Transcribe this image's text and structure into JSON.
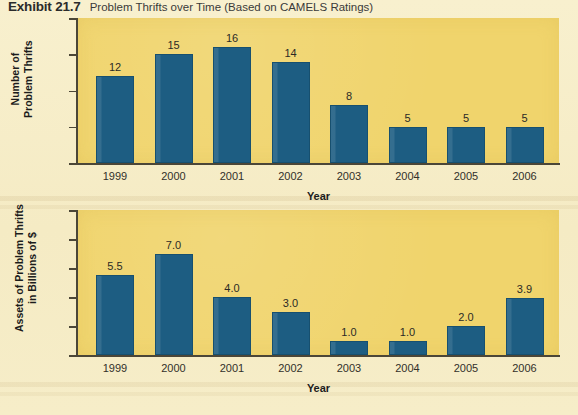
{
  "exhibit": {
    "number": "Exhibit 21.7",
    "caption": "Problem Thrifts over Time (Based on CAMELS Ratings)"
  },
  "colors": {
    "panel": "#f0d46c",
    "bar": "#1d5d82",
    "page": "#f6edc8",
    "axis": "#4b4637"
  },
  "chart_data": [
    {
      "type": "bar",
      "title": "Problem Thrifts over Time (Based on CAMELS Ratings)",
      "categories": [
        "1999",
        "2000",
        "2001",
        "2002",
        "2003",
        "2004",
        "2005",
        "2006"
      ],
      "values": [
        12,
        15,
        16,
        14,
        8,
        5,
        5,
        5
      ],
      "value_labels": [
        "12",
        "15",
        "16",
        "14",
        "8",
        "5",
        "5",
        "5"
      ],
      "xlabel": "Year",
      "ylabel": "Number of Problem Thrifts",
      "ylabel_lines": [
        "Number of",
        "Problem Thrifts"
      ],
      "ylim": [
        0,
        20
      ],
      "yticks": [
        0,
        5,
        10,
        15,
        20
      ],
      "ytick_labels": [
        "0",
        "5",
        "10",
        "15",
        "20"
      ],
      "grid": false,
      "legend": null
    },
    {
      "type": "bar",
      "title": "Assets of Problem Thrifts over Time",
      "categories": [
        "1999",
        "2000",
        "2001",
        "2002",
        "2003",
        "2004",
        "2005",
        "2006"
      ],
      "values": [
        5.5,
        7.0,
        4.0,
        3.0,
        1.0,
        1.0,
        2.0,
        3.9
      ],
      "value_labels": [
        "5.5",
        "7.0",
        "4.0",
        "3.0",
        "1.0",
        "1.0",
        "2.0",
        "3.9"
      ],
      "xlabel": "Year",
      "ylabel": "Assets of Problem Thrifts in Billions of $",
      "ylabel_lines": [
        "Assets of Problem Thrifts",
        "in Billions of $"
      ],
      "ylim": [
        0,
        10
      ],
      "yticks": [
        0,
        2,
        4,
        6,
        8,
        10
      ],
      "ytick_labels": [
        "0",
        "2",
        "4",
        "6",
        "8",
        "10"
      ],
      "grid": false,
      "legend": null
    }
  ]
}
